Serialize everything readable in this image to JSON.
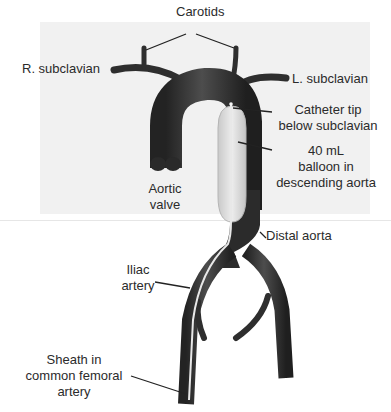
{
  "diagram": {
    "labels": {
      "carotids": "Carotids",
      "r_subclavian": "R. subclavian",
      "l_subclavian": "L. subclavian",
      "catheter_tip_line1": "Catheter tip",
      "catheter_tip_line2": "below subclavian",
      "balloon_line1": "40 mL",
      "balloon_line2": "balloon in",
      "balloon_line3": "descending aorta",
      "aortic_valve_line1": "Aortic",
      "aortic_valve_line2": "valve",
      "distal_aorta": "Distal aorta",
      "iliac_line1": "Iliac",
      "iliac_line2": "artery",
      "sheath_line1": "Sheath in",
      "sheath_line2": "common femoral",
      "sheath_line3": "artery"
    },
    "colors": {
      "vessel": "#2e2e2e",
      "vessel_highlight": "#5a5a5a",
      "balloon": "#d9d9d9",
      "balloon_edge": "#b5b5b5",
      "catheter": "#e8e8e8",
      "leader_line": "#222222",
      "background_panel": "#f1f1f1"
    }
  }
}
